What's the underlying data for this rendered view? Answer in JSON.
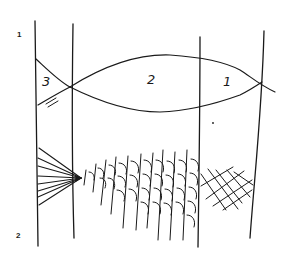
{
  "figure": {
    "row_labels": [
      "1",
      "2"
    ],
    "region_labels": [
      "3",
      "2",
      "1"
    ],
    "ink_color": "#1a1a1a",
    "background": "#ffffff"
  }
}
